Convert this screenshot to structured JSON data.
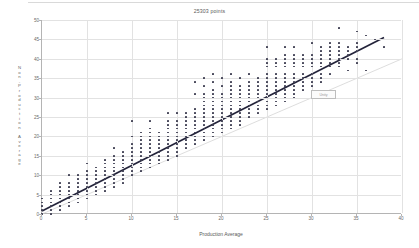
{
  "chart_data": {
    "type": "scatter",
    "title": "25303 points",
    "xlabel": "Production Average",
    "ylabel": "Non-Production Average",
    "ylabel_letters": [
      "N",
      "o",
      "n",
      "-",
      "P",
      "r",
      "o",
      "d",
      "u",
      "c",
      "t",
      "i",
      "o",
      "n",
      " ",
      "A",
      "v",
      "e",
      "r",
      "a",
      "g",
      "e"
    ],
    "xlim": [
      0,
      40
    ],
    "ylim": [
      0,
      50
    ],
    "xticks": [
      0,
      5,
      10,
      15,
      20,
      25,
      30,
      35,
      40
    ],
    "yticks": [
      0,
      5,
      10,
      15,
      20,
      25,
      30,
      35,
      40,
      45,
      50
    ],
    "grid": true,
    "legend": "none",
    "point_color": "#3c3c50",
    "fit_line_color": "#23233a",
    "reference_line_color": "#cfcfcf",
    "fit_line": {
      "x0": 0,
      "y0": 0.8,
      "x1": 38,
      "y1": 45.5
    },
    "reference_line": {
      "x0": 0,
      "y0": 0,
      "x1": 40,
      "y1": 40
    },
    "annotation": {
      "text": "Unity",
      "x": 30.0,
      "y": 31.0
    },
    "points": [
      [
        0,
        0
      ],
      [
        0,
        1
      ],
      [
        0,
        2
      ],
      [
        0,
        3
      ],
      [
        0,
        4
      ],
      [
        1,
        0
      ],
      [
        1,
        1
      ],
      [
        1,
        2
      ],
      [
        1,
        3
      ],
      [
        1,
        4
      ],
      [
        1,
        5
      ],
      [
        1,
        6
      ],
      [
        2,
        1
      ],
      [
        2,
        2
      ],
      [
        2,
        3
      ],
      [
        2,
        4
      ],
      [
        2,
        5
      ],
      [
        2,
        6
      ],
      [
        2,
        7
      ],
      [
        2,
        8
      ],
      [
        3,
        2
      ],
      [
        3,
        3
      ],
      [
        3,
        4
      ],
      [
        3,
        5
      ],
      [
        3,
        6
      ],
      [
        3,
        7
      ],
      [
        3,
        8
      ],
      [
        3,
        10
      ],
      [
        4,
        3
      ],
      [
        4,
        4
      ],
      [
        4,
        5
      ],
      [
        4,
        6
      ],
      [
        4,
        7
      ],
      [
        4,
        8
      ],
      [
        4,
        9
      ],
      [
        4,
        10
      ],
      [
        5,
        4
      ],
      [
        5,
        5
      ],
      [
        5,
        6
      ],
      [
        5,
        7
      ],
      [
        5,
        8
      ],
      [
        5,
        9
      ],
      [
        5,
        10
      ],
      [
        5,
        11
      ],
      [
        5,
        13
      ],
      [
        6,
        5
      ],
      [
        6,
        6
      ],
      [
        6,
        7
      ],
      [
        6,
        8
      ],
      [
        6,
        9
      ],
      [
        6,
        10
      ],
      [
        6,
        11
      ],
      [
        6,
        12
      ],
      [
        7,
        6
      ],
      [
        7,
        7
      ],
      [
        7,
        8
      ],
      [
        7,
        9
      ],
      [
        7,
        10
      ],
      [
        7,
        11
      ],
      [
        7,
        12
      ],
      [
        7,
        13
      ],
      [
        7,
        14
      ],
      [
        8,
        7
      ],
      [
        8,
        8
      ],
      [
        8,
        9
      ],
      [
        8,
        10
      ],
      [
        8,
        11
      ],
      [
        8,
        12
      ],
      [
        8,
        13
      ],
      [
        8,
        14
      ],
      [
        8,
        15
      ],
      [
        8,
        17
      ],
      [
        9,
        8
      ],
      [
        9,
        9
      ],
      [
        9,
        10
      ],
      [
        9,
        11
      ],
      [
        9,
        12
      ],
      [
        9,
        13
      ],
      [
        9,
        14
      ],
      [
        9,
        15
      ],
      [
        9,
        16
      ],
      [
        10,
        10
      ],
      [
        10,
        11
      ],
      [
        10,
        12
      ],
      [
        10,
        13
      ],
      [
        10,
        14
      ],
      [
        10,
        15
      ],
      [
        10,
        16
      ],
      [
        10,
        17
      ],
      [
        10,
        18
      ],
      [
        10,
        20
      ],
      [
        10,
        24
      ],
      [
        11,
        11
      ],
      [
        11,
        12
      ],
      [
        11,
        13
      ],
      [
        11,
        14
      ],
      [
        11,
        15
      ],
      [
        11,
        16
      ],
      [
        11,
        17
      ],
      [
        11,
        18
      ],
      [
        11,
        19
      ],
      [
        11,
        20
      ],
      [
        11,
        21
      ],
      [
        12,
        12
      ],
      [
        12,
        13
      ],
      [
        12,
        14
      ],
      [
        12,
        15
      ],
      [
        12,
        16
      ],
      [
        12,
        17
      ],
      [
        12,
        18
      ],
      [
        12,
        19
      ],
      [
        12,
        20
      ],
      [
        12,
        21
      ],
      [
        12,
        22
      ],
      [
        12,
        24
      ],
      [
        13,
        13
      ],
      [
        13,
        14
      ],
      [
        13,
        15
      ],
      [
        13,
        16
      ],
      [
        13,
        17
      ],
      [
        13,
        18
      ],
      [
        13,
        19
      ],
      [
        13,
        20
      ],
      [
        13,
        21
      ],
      [
        14,
        14
      ],
      [
        14,
        15
      ],
      [
        14,
        16
      ],
      [
        14,
        17
      ],
      [
        14,
        18
      ],
      [
        14,
        19
      ],
      [
        14,
        20
      ],
      [
        14,
        21
      ],
      [
        14,
        22
      ],
      [
        14,
        23
      ],
      [
        14,
        24
      ],
      [
        14,
        26
      ],
      [
        15,
        15
      ],
      [
        15,
        16
      ],
      [
        15,
        17
      ],
      [
        15,
        18
      ],
      [
        15,
        19
      ],
      [
        15,
        20
      ],
      [
        15,
        21
      ],
      [
        15,
        22
      ],
      [
        15,
        23
      ],
      [
        15,
        24
      ],
      [
        15,
        26
      ],
      [
        16,
        17
      ],
      [
        16,
        18
      ],
      [
        16,
        19
      ],
      [
        16,
        20
      ],
      [
        16,
        21
      ],
      [
        16,
        22
      ],
      [
        16,
        23
      ],
      [
        16,
        24
      ],
      [
        16,
        25
      ],
      [
        16,
        26
      ],
      [
        17,
        18
      ],
      [
        17,
        19
      ],
      [
        17,
        20
      ],
      [
        17,
        21
      ],
      [
        17,
        22
      ],
      [
        17,
        23
      ],
      [
        17,
        24
      ],
      [
        17,
        25
      ],
      [
        17,
        26
      ],
      [
        17,
        27
      ],
      [
        17,
        31
      ],
      [
        17,
        34
      ],
      [
        18,
        19
      ],
      [
        18,
        20
      ],
      [
        18,
        21
      ],
      [
        18,
        22
      ],
      [
        18,
        23
      ],
      [
        18,
        24
      ],
      [
        18,
        25
      ],
      [
        18,
        26
      ],
      [
        18,
        27
      ],
      [
        18,
        28
      ],
      [
        18,
        29
      ],
      [
        18,
        30
      ],
      [
        18,
        31
      ],
      [
        18,
        33
      ],
      [
        18,
        35
      ],
      [
        19,
        20
      ],
      [
        19,
        21
      ],
      [
        19,
        22
      ],
      [
        19,
        23
      ],
      [
        19,
        24
      ],
      [
        19,
        25
      ],
      [
        19,
        26
      ],
      [
        19,
        27
      ],
      [
        19,
        28
      ],
      [
        19,
        29
      ],
      [
        19,
        30
      ],
      [
        19,
        31
      ],
      [
        19,
        32
      ],
      [
        19,
        34
      ],
      [
        19,
        36
      ],
      [
        20,
        21
      ],
      [
        20,
        22
      ],
      [
        20,
        23
      ],
      [
        20,
        24
      ],
      [
        20,
        25
      ],
      [
        20,
        26
      ],
      [
        20,
        27
      ],
      [
        20,
        28
      ],
      [
        20,
        29
      ],
      [
        20,
        30
      ],
      [
        20,
        31
      ],
      [
        20,
        33
      ],
      [
        20,
        35
      ],
      [
        21,
        22
      ],
      [
        21,
        23
      ],
      [
        21,
        24
      ],
      [
        21,
        25
      ],
      [
        21,
        26
      ],
      [
        21,
        27
      ],
      [
        21,
        28
      ],
      [
        21,
        29
      ],
      [
        21,
        30
      ],
      [
        21,
        31
      ],
      [
        21,
        32
      ],
      [
        21,
        33
      ],
      [
        21,
        34
      ],
      [
        21,
        36
      ],
      [
        22,
        23
      ],
      [
        22,
        24
      ],
      [
        22,
        25
      ],
      [
        22,
        26
      ],
      [
        22,
        27
      ],
      [
        22,
        28
      ],
      [
        22,
        29
      ],
      [
        22,
        30
      ],
      [
        22,
        31
      ],
      [
        22,
        32
      ],
      [
        22,
        33
      ],
      [
        22,
        35
      ],
      [
        23,
        25
      ],
      [
        23,
        26
      ],
      [
        23,
        27
      ],
      [
        23,
        28
      ],
      [
        23,
        29
      ],
      [
        23,
        30
      ],
      [
        23,
        31
      ],
      [
        23,
        32
      ],
      [
        23,
        33
      ],
      [
        23,
        34
      ],
      [
        23,
        36
      ],
      [
        24,
        26
      ],
      [
        24,
        27
      ],
      [
        24,
        28
      ],
      [
        24,
        29
      ],
      [
        24,
        30
      ],
      [
        24,
        31
      ],
      [
        24,
        32
      ],
      [
        24,
        33
      ],
      [
        24,
        34
      ],
      [
        24,
        35
      ],
      [
        25,
        27
      ],
      [
        25,
        28
      ],
      [
        25,
        29
      ],
      [
        25,
        30
      ],
      [
        25,
        31
      ],
      [
        25,
        32
      ],
      [
        25,
        33
      ],
      [
        25,
        34
      ],
      [
        25,
        35
      ],
      [
        25,
        36
      ],
      [
        25,
        38
      ],
      [
        25,
        39
      ],
      [
        25,
        40
      ],
      [
        25,
        43
      ],
      [
        26,
        28
      ],
      [
        26,
        29
      ],
      [
        26,
        30
      ],
      [
        26,
        31
      ],
      [
        26,
        32
      ],
      [
        26,
        33
      ],
      [
        26,
        34
      ],
      [
        26,
        35
      ],
      [
        26,
        36
      ],
      [
        26,
        38
      ],
      [
        26,
        39
      ],
      [
        26,
        40
      ],
      [
        27,
        29
      ],
      [
        27,
        30
      ],
      [
        27,
        31
      ],
      [
        27,
        32
      ],
      [
        27,
        33
      ],
      [
        27,
        34
      ],
      [
        27,
        35
      ],
      [
        27,
        36
      ],
      [
        27,
        38
      ],
      [
        27,
        39
      ],
      [
        27,
        40
      ],
      [
        27,
        41
      ],
      [
        27,
        43
      ],
      [
        28,
        30
      ],
      [
        28,
        31
      ],
      [
        28,
        32
      ],
      [
        28,
        33
      ],
      [
        28,
        34
      ],
      [
        28,
        35
      ],
      [
        28,
        36
      ],
      [
        28,
        38
      ],
      [
        28,
        39
      ],
      [
        28,
        40
      ],
      [
        28,
        41
      ],
      [
        28,
        43
      ],
      [
        29,
        32
      ],
      [
        29,
        33
      ],
      [
        29,
        34
      ],
      [
        29,
        35
      ],
      [
        29,
        36
      ],
      [
        29,
        38
      ],
      [
        29,
        39
      ],
      [
        29,
        40
      ],
      [
        29,
        41
      ],
      [
        30,
        33
      ],
      [
        30,
        34
      ],
      [
        30,
        35
      ],
      [
        30,
        36
      ],
      [
        30,
        38
      ],
      [
        30,
        39
      ],
      [
        30,
        40
      ],
      [
        30,
        41
      ],
      [
        30,
        44
      ],
      [
        31,
        34
      ],
      [
        31,
        35
      ],
      [
        31,
        36
      ],
      [
        31,
        38
      ],
      [
        31,
        39
      ],
      [
        31,
        40
      ],
      [
        31,
        41
      ],
      [
        31,
        42
      ],
      [
        31,
        43
      ],
      [
        32,
        36
      ],
      [
        32,
        38
      ],
      [
        32,
        39
      ],
      [
        32,
        40
      ],
      [
        32,
        41
      ],
      [
        32,
        42
      ],
      [
        32,
        43
      ],
      [
        32,
        44
      ],
      [
        33,
        38
      ],
      [
        33,
        39
      ],
      [
        33,
        40
      ],
      [
        33,
        41
      ],
      [
        33,
        42
      ],
      [
        33,
        43
      ],
      [
        33,
        44
      ],
      [
        33,
        48
      ],
      [
        34,
        37
      ],
      [
        34,
        40
      ],
      [
        34,
        41
      ],
      [
        34,
        42
      ],
      [
        34,
        43
      ],
      [
        35,
        39
      ],
      [
        35,
        40
      ],
      [
        35,
        42
      ],
      [
        35,
        43
      ],
      [
        35,
        44
      ],
      [
        35,
        47
      ],
      [
        36,
        37
      ],
      [
        36,
        46
      ],
      [
        37,
        45
      ],
      [
        38,
        43
      ]
    ]
  }
}
